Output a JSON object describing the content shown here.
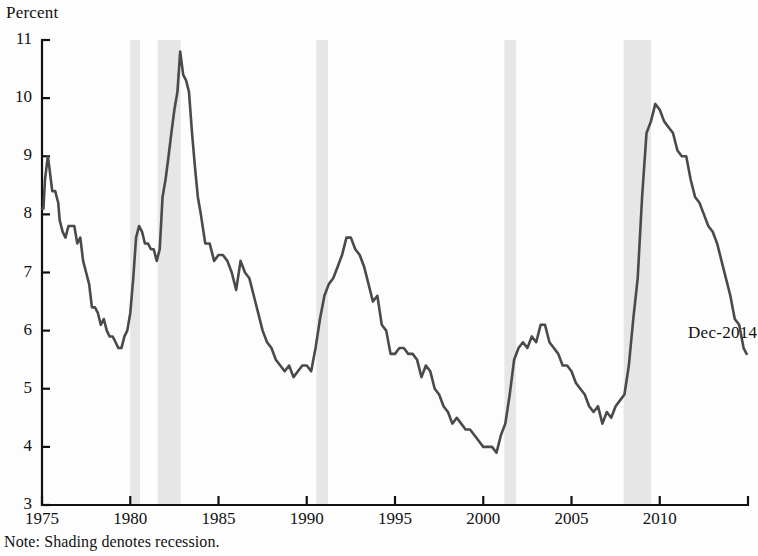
{
  "axis_title": "Percent",
  "note": "Note: Shading denotes recession.",
  "end_label": "Dec-2014",
  "colors": {
    "line": "#4a4a4a",
    "axis": "#111111",
    "shading": "#e6e6e6",
    "background": "#fdfdfd"
  },
  "chart_data": {
    "type": "line",
    "title": "",
    "subtitle": "",
    "xlabel": "",
    "ylabel": "Percent",
    "xlim": [
      1975,
      2015
    ],
    "ylim": [
      3,
      11
    ],
    "grid": false,
    "legend": null,
    "yticks": [
      3,
      4,
      5,
      6,
      7,
      8,
      9,
      10,
      11
    ],
    "xticks": [
      1975,
      1980,
      1985,
      1990,
      1995,
      2000,
      2005,
      2010
    ],
    "annotations": [
      {
        "text": "Dec-2014",
        "x": 2011.6,
        "y": 5.95
      }
    ],
    "shaded_regions": [
      {
        "label": "recession",
        "x0": 1980.0,
        "x1": 1980.55
      },
      {
        "label": "recession",
        "x0": 1981.55,
        "x1": 1982.85
      },
      {
        "label": "recession",
        "x0": 1990.55,
        "x1": 1991.2
      },
      {
        "label": "recession",
        "x0": 2001.2,
        "x1": 2001.85
      },
      {
        "label": "recession",
        "x0": 2007.95,
        "x1": 2009.5
      }
    ],
    "series": [
      {
        "name": "Unemployment rate",
        "x": [
          1975.0,
          1975.08,
          1975.17,
          1975.25,
          1975.33,
          1975.42,
          1975.5,
          1975.58,
          1975.67,
          1975.75,
          1975.83,
          1975.92,
          1976.0,
          1976.17,
          1976.33,
          1976.5,
          1976.67,
          1976.83,
          1977.0,
          1977.17,
          1977.33,
          1977.5,
          1977.67,
          1977.83,
          1978.0,
          1978.17,
          1978.33,
          1978.5,
          1978.67,
          1978.83,
          1979.0,
          1979.17,
          1979.33,
          1979.5,
          1979.67,
          1979.83,
          1980.0,
          1980.17,
          1980.33,
          1980.5,
          1980.67,
          1980.83,
          1981.0,
          1981.17,
          1981.33,
          1981.5,
          1981.67,
          1981.83,
          1982.0,
          1982.17,
          1982.33,
          1982.5,
          1982.67,
          1982.83,
          1983.0,
          1983.17,
          1983.33,
          1983.5,
          1983.67,
          1983.83,
          1984.0,
          1984.25,
          1984.5,
          1984.75,
          1985.0,
          1985.25,
          1985.5,
          1985.75,
          1986.0,
          1986.25,
          1986.5,
          1986.75,
          1987.0,
          1987.25,
          1987.5,
          1987.75,
          1988.0,
          1988.25,
          1988.5,
          1988.75,
          1989.0,
          1989.25,
          1989.5,
          1989.75,
          1990.0,
          1990.25,
          1990.5,
          1990.75,
          1991.0,
          1991.25,
          1991.5,
          1991.75,
          1992.0,
          1992.25,
          1992.5,
          1992.75,
          1993.0,
          1993.25,
          1993.5,
          1993.75,
          1994.0,
          1994.25,
          1994.5,
          1994.75,
          1995.0,
          1995.25,
          1995.5,
          1995.75,
          1996.0,
          1996.25,
          1996.5,
          1996.75,
          1997.0,
          1997.25,
          1997.5,
          1997.75,
          1998.0,
          1998.25,
          1998.5,
          1998.75,
          1999.0,
          1999.25,
          1999.5,
          1999.75,
          2000.0,
          2000.25,
          2000.5,
          2000.75,
          2001.0,
          2001.25,
          2001.5,
          2001.75,
          2002.0,
          2002.25,
          2002.5,
          2002.75,
          2003.0,
          2003.25,
          2003.5,
          2003.75,
          2004.0,
          2004.25,
          2004.5,
          2004.75,
          2005.0,
          2005.25,
          2005.5,
          2005.75,
          2006.0,
          2006.25,
          2006.5,
          2006.75,
          2007.0,
          2007.25,
          2007.5,
          2007.75,
          2008.0,
          2008.25,
          2008.5,
          2008.75,
          2009.0,
          2009.25,
          2009.5,
          2009.75,
          2010.0,
          2010.25,
          2010.5,
          2010.75,
          2011.0,
          2011.25,
          2011.5,
          2011.75,
          2012.0,
          2012.25,
          2012.5,
          2012.75,
          2013.0,
          2013.25,
          2013.5,
          2013.75,
          2014.0,
          2014.25,
          2014.5,
          2014.75,
          2014.92
        ],
        "y": [
          8.1,
          8.1,
          8.6,
          8.8,
          9.0,
          8.8,
          8.6,
          8.4,
          8.4,
          8.4,
          8.3,
          8.2,
          7.9,
          7.7,
          7.6,
          7.8,
          7.8,
          7.8,
          7.5,
          7.6,
          7.2,
          7.0,
          6.8,
          6.4,
          6.4,
          6.3,
          6.1,
          6.2,
          6.0,
          5.9,
          5.9,
          5.8,
          5.7,
          5.7,
          5.9,
          6.0,
          6.3,
          6.9,
          7.6,
          7.8,
          7.7,
          7.5,
          7.5,
          7.4,
          7.4,
          7.2,
          7.4,
          8.3,
          8.6,
          9.0,
          9.4,
          9.8,
          10.1,
          10.8,
          10.4,
          10.3,
          10.1,
          9.4,
          8.8,
          8.3,
          8.0,
          7.5,
          7.5,
          7.2,
          7.3,
          7.3,
          7.2,
          7.0,
          6.7,
          7.2,
          7.0,
          6.9,
          6.6,
          6.3,
          6.0,
          5.8,
          5.7,
          5.5,
          5.4,
          5.3,
          5.4,
          5.2,
          5.3,
          5.4,
          5.4,
          5.3,
          5.7,
          6.2,
          6.6,
          6.8,
          6.9,
          7.1,
          7.3,
          7.6,
          7.6,
          7.4,
          7.3,
          7.1,
          6.8,
          6.5,
          6.6,
          6.1,
          6.0,
          5.6,
          5.6,
          5.7,
          5.7,
          5.6,
          5.6,
          5.5,
          5.2,
          5.4,
          5.3,
          5.0,
          4.9,
          4.7,
          4.6,
          4.4,
          4.5,
          4.4,
          4.3,
          4.3,
          4.2,
          4.1,
          4.0,
          4.0,
          4.0,
          3.9,
          4.2,
          4.4,
          4.9,
          5.5,
          5.7,
          5.8,
          5.7,
          5.9,
          5.8,
          6.1,
          6.1,
          5.8,
          5.7,
          5.6,
          5.4,
          5.4,
          5.3,
          5.1,
          5.0,
          4.9,
          4.7,
          4.6,
          4.7,
          4.4,
          4.6,
          4.5,
          4.7,
          4.8,
          4.9,
          5.4,
          6.2,
          6.9,
          8.3,
          9.4,
          9.6,
          9.9,
          9.8,
          9.6,
          9.5,
          9.4,
          9.1,
          9.0,
          9.0,
          8.6,
          8.3,
          8.2,
          8.0,
          7.8,
          7.7,
          7.5,
          7.2,
          6.9,
          6.6,
          6.2,
          6.1,
          5.7,
          5.6
        ]
      }
    ]
  }
}
